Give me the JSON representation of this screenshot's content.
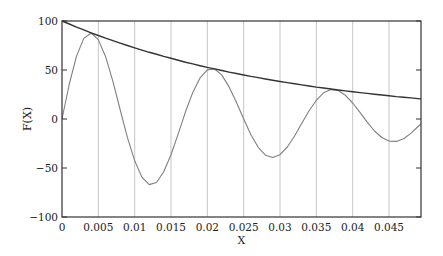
{
  "chart_data": {
    "type": "line",
    "title": "",
    "xlabel": "X",
    "ylabel": "F(X)",
    "xlim": [
      0,
      0.0494
    ],
    "ylim": [
      -100,
      100
    ],
    "grid": {
      "vertical": true,
      "horizontal": false
    },
    "legend": null,
    "xticks": [
      0,
      0.005,
      0.01,
      0.015,
      0.02,
      0.025,
      0.03,
      0.035,
      0.04,
      0.045
    ],
    "xtick_labels": [
      "0",
      "0.005",
      "0.01",
      "0.015",
      "0.02",
      "0.025",
      "0.03",
      "0.035",
      "0.04",
      "0.045"
    ],
    "yticks": [
      -100,
      -50,
      0,
      50,
      100
    ],
    "ytick_labels": [
      "−100",
      "−50",
      "0",
      "50",
      "100"
    ],
    "x": [
      0,
      0.001,
      0.002,
      0.003,
      0.004,
      0.005,
      0.006,
      0.007,
      0.008,
      0.009,
      0.01,
      0.011,
      0.012,
      0.013,
      0.014,
      0.015,
      0.016,
      0.017,
      0.018,
      0.019,
      0.02,
      0.021,
      0.022,
      0.023,
      0.024,
      0.025,
      0.026,
      0.027,
      0.028,
      0.029,
      0.03,
      0.031,
      0.032,
      0.033,
      0.034,
      0.035,
      0.036,
      0.037,
      0.038,
      0.039,
      0.04,
      0.041,
      0.042,
      0.043,
      0.044,
      0.045,
      0.046,
      0.047,
      0.048,
      0.049
    ],
    "series": [
      {
        "name": "damped oscillation",
        "color": "#808080",
        "values": [
          0,
          35.7,
          64.2,
          82.2,
          87.8,
          81.0,
          63.6,
          38.5,
          9.7,
          -18.7,
          -42.7,
          -59.3,
          -66.9,
          -64.8,
          -53.9,
          -36.4,
          -14.9,
          7.3,
          27.1,
          42.0,
          50.1,
          51.0,
          44.8,
          32.8,
          17.1,
          0,
          -16.0,
          -28.9,
          -36.9,
          -39.4,
          -36.4,
          -28.6,
          -17.3,
          -4.3,
          8.4,
          19.2,
          26.7,
          30.0,
          29.1,
          24.2,
          16.3,
          6.7,
          -3.3,
          -12.2,
          -18.9,
          -22.6,
          -22.9,
          -20.1,
          -14.7,
          -7.7
        ]
      },
      {
        "name": "envelope",
        "color": "#333333",
        "values": [
          100,
          96.9,
          93.8,
          90.9,
          88.0,
          85.2,
          82.5,
          79.9,
          77.4,
          75.0,
          72.6,
          70.3,
          68.1,
          66.0,
          63.9,
          61.9,
          59.9,
          58.0,
          56.2,
          54.4,
          52.7,
          51.1,
          49.5,
          47.9,
          46.4,
          44.9,
          43.5,
          42.2,
          40.8,
          39.5,
          38.3,
          37.1,
          35.9,
          34.8,
          33.7,
          32.6,
          31.6,
          30.6,
          29.6,
          28.7,
          27.8,
          26.9,
          26.1,
          25.3,
          24.5,
          23.7,
          22.9,
          22.2,
          21.5,
          20.8
        ]
      }
    ]
  },
  "plot": {
    "x_axis_label": "X",
    "y_axis_label": "F(X)"
  }
}
